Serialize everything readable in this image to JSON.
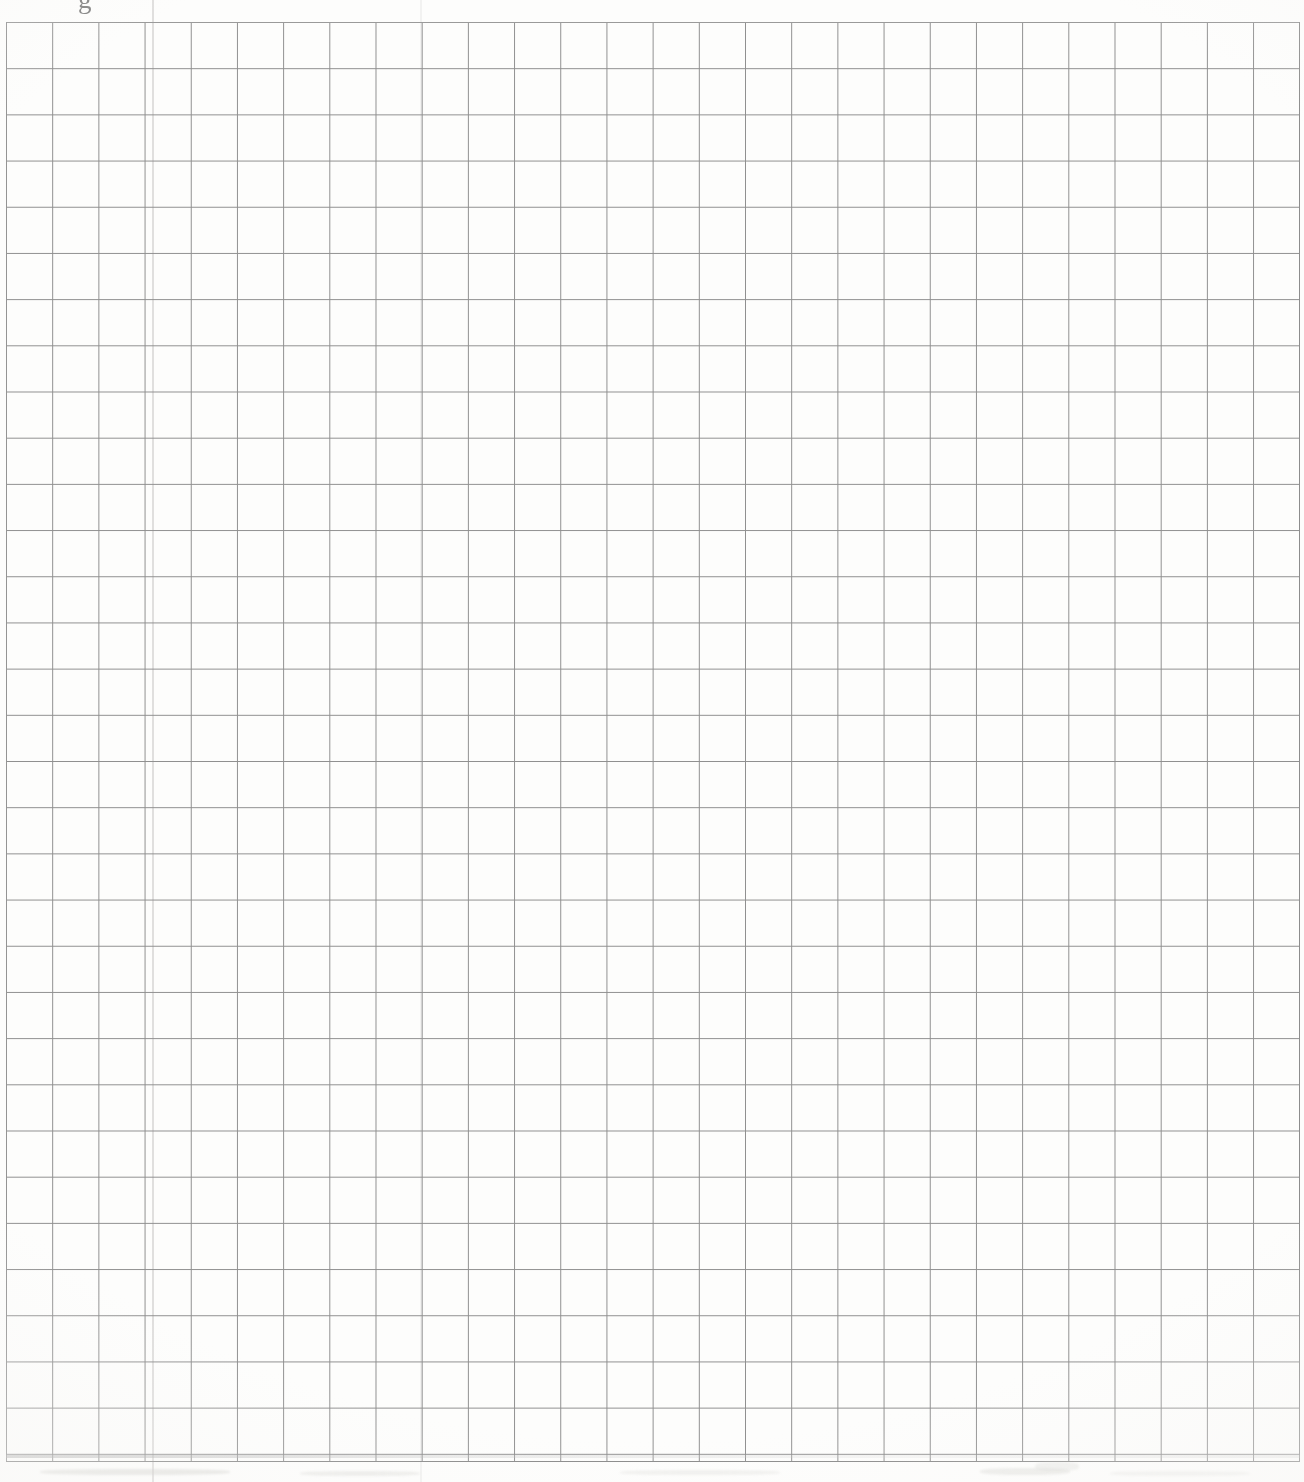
{
  "document": {
    "type": "scanned-graph-paper",
    "title": "Blank quadrille / graph paper sheet",
    "page_width_px": 1304,
    "page_height_px": 1482,
    "paper_color": "#fdfdfc",
    "background_color": "#ffffff"
  },
  "grid": {
    "line_color": "#8f8f8f",
    "border_color": "#8a8a8a",
    "cell_size_px": 46.2,
    "columns": 28,
    "rows": 31,
    "left_px": 6,
    "top_px": 22,
    "width_px": 1294,
    "height_px": 1440,
    "line_weight_px": 1.1,
    "content": "empty"
  },
  "artifacts": {
    "header_fragment_text": "g",
    "header_fragment_note": "cut-off glyph at top edge of scan",
    "bottom_smudges": 6,
    "fold_seams": 2,
    "vignette": "radial paper-tone falloff at page edges"
  },
  "chart_data": {
    "type": "table",
    "xlabel": "",
    "ylabel": "",
    "categories": [],
    "values": [],
    "grid": true,
    "legend": "none",
    "columns": 28,
    "rows": 31,
    "cell_size_px": 46.2
  }
}
